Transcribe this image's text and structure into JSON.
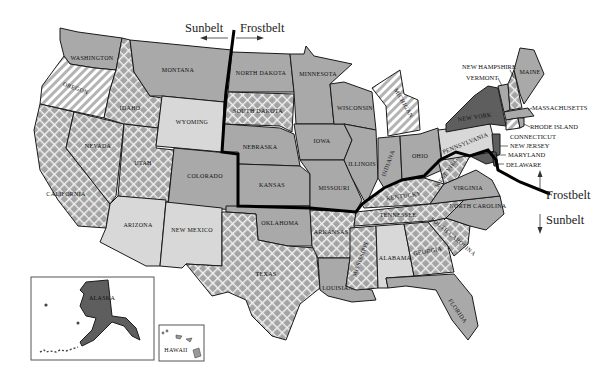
{
  "map": {
    "title": "Sunbelt and Frostbelt",
    "divider_labels": {
      "top_left": "Sunbelt",
      "top_right": "Frostbelt",
      "right_up": "Frostbelt",
      "right_down": "Sunbelt"
    },
    "states": {
      "washington": "WASHINGTON",
      "oregon": "OREGON",
      "california": "CALIFORNIA",
      "idaho": "IDAHO",
      "nevada": "NEVADA",
      "montana": "MONTANA",
      "wyoming": "WYOMING",
      "utah": "UTAH",
      "arizona": "ARIZONA",
      "colorado": "COLORADO",
      "new_mexico": "NEW MEXICO",
      "north_dakota": "NORTH DAKOTA",
      "south_dakota": "SOUTH DAKOTA",
      "nebraska": "NEBRASKA",
      "kansas": "KANSAS",
      "oklahoma": "OKLAHOMA",
      "texas": "TEXAS",
      "minnesota": "MINNESOTA",
      "iowa": "IOWA",
      "missouri": "MISSOURI",
      "arkansas": "ARKANSAS",
      "louisiana": "LOUISIANA",
      "wisconsin": "WISCONSIN",
      "illinois": "ILLINOIS",
      "michigan": "MICHIGAN",
      "indiana": "INDIANA",
      "ohio": "OHIO",
      "kentucky": "KENTUCKY",
      "tennessee": "TENNESSEE",
      "mississippi": "MISSISSIPPI",
      "alabama": "ALABAMA",
      "georgia": "GEORGIA",
      "florida": "FLORIDA",
      "south_carolina": "SOUTH CAROLINA",
      "north_carolina": "NORTH CAROLINA",
      "virginia": "VIRGINIA",
      "west_virginia": "WEST VIRGINIA",
      "pennsylvania": "PENNSYLVANIA",
      "new_york": "NEW YORK",
      "maine": "MAINE",
      "alaska": "ALASKA",
      "hawaii": "HAWAII"
    },
    "callouts": {
      "new_hampshire": "NEW HAMPSHIRE",
      "vermont": "VERMONT",
      "massachusetts": "MASSACHUSETTS",
      "rhode_island": "RHODE ISLAND",
      "connecticut": "CONNECTICUT",
      "new_jersey": "NEW JERSEY",
      "maryland": "MARYLAND",
      "delaware": "DELAWARE"
    },
    "colors": {
      "plain_gray": "#a9a9a9",
      "light_gray": "#d8d8d8",
      "dark_gray": "#5e5e5e",
      "divider": "#000000",
      "background": "#ffffff"
    }
  }
}
